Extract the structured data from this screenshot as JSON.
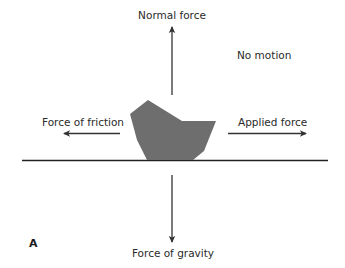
{
  "diagram": {
    "panel_label": "A",
    "state_label": "No motion",
    "forces": {
      "normal": {
        "label": "Normal force",
        "direction": "up"
      },
      "gravity": {
        "label": "Force of gravity",
        "direction": "down"
      },
      "friction": {
        "label": "Force of friction",
        "direction": "left"
      },
      "applied": {
        "label": "Applied force",
        "direction": "right"
      }
    },
    "object": {
      "shape": "irregular-polygon",
      "fill": "#6e6e6e"
    },
    "colors": {
      "arrow": "#333333",
      "ground": "#222222",
      "object_fill": "#6e6e6e",
      "text": "#2a2a2a"
    }
  }
}
